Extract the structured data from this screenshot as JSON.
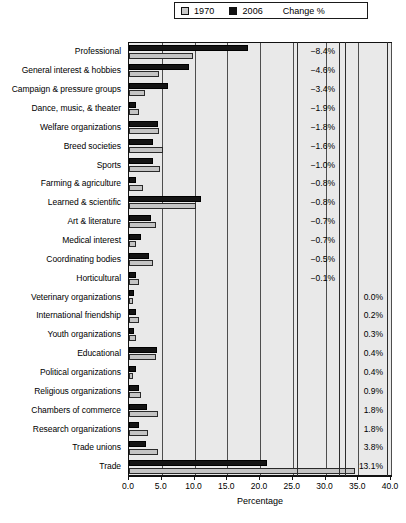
{
  "legend": {
    "items": [
      {
        "label": "1970",
        "color": "#c9c9c9",
        "icon": "legend-swatch-1970"
      },
      {
        "label": "2006",
        "color": "#121212",
        "icon": "legend-swatch-2006"
      }
    ],
    "change_label": "Change %"
  },
  "axis": {
    "title": "Percentage",
    "ticks": [
      "0.0",
      "5.0",
      "10.0",
      "15.0",
      "20.0",
      "25.0",
      "30.0",
      "35.0",
      "40.0"
    ]
  },
  "chart_data": {
    "type": "bar",
    "orientation": "horizontal",
    "title": "",
    "subtitle": "",
    "xlabel": "Percentage",
    "ylabel": "",
    "xlim": [
      0.0,
      40.0
    ],
    "xticks": [
      0.0,
      5.0,
      10.0,
      15.0,
      20.0,
      25.0,
      30.0,
      35.0,
      40.0
    ],
    "grid": true,
    "legend_position": "top",
    "categories": [
      "Professional",
      "General interest & hobbies",
      "Campaign & pressure groups",
      "Dance, music, & theater",
      "Welfare organizations",
      "Breed societies",
      "Sports",
      "Farming & agriculture",
      "Learned & scientific",
      "Art & literature",
      "Medical interest",
      "Coordinating bodies",
      "Horticultural",
      "Veterinary organizations",
      "International friendship",
      "Youth organizations",
      "Educational",
      "Political organizations",
      "Religious organizations",
      "Chambers of commerce",
      "Research organizations",
      "Trade unions",
      "Trade"
    ],
    "series": [
      {
        "name": "1970",
        "color": "#c9c9c9",
        "values": [
          9.8,
          4.6,
          2.4,
          1.5,
          4.6,
          5.2,
          4.7,
          2.2,
          10.2,
          4.1,
          1.1,
          3.6,
          1.5,
          0.6,
          1.5,
          1.1,
          4.1,
          0.6,
          1.9,
          4.4,
          2.9,
          4.4,
          34.5
        ]
      },
      {
        "name": "2006",
        "color": "#121212",
        "values": [
          18.2,
          9.2,
          5.9,
          1.1,
          4.4,
          3.7,
          3.7,
          1.1,
          11.0,
          3.4,
          1.8,
          3.1,
          1.1,
          0.7,
          1.0,
          0.7,
          4.3,
          1.0,
          1.5,
          2.8,
          1.5,
          2.6,
          21.0
        ]
      }
    ],
    "change_percent": [
      "−8.4%",
      "−4.6%",
      "−3.4%",
      "−1.9%",
      "−1.8%",
      "−1.6%",
      "−1.0%",
      "−0.8%",
      "−0.8%",
      "−0.7%",
      "−0.7%",
      "−0.5%",
      "−0.1%",
      "0.0%",
      "0.2%",
      "0.3%",
      "0.4%",
      "0.4%",
      "0.9%",
      "1.8%",
      "1.8%",
      "3.8%",
      "13.1%"
    ],
    "change_sign": [
      "neg",
      "neg",
      "neg",
      "neg",
      "neg",
      "neg",
      "neg",
      "neg",
      "neg",
      "neg",
      "neg",
      "neg",
      "neg",
      "pos",
      "pos",
      "pos",
      "pos",
      "pos",
      "pos",
      "pos",
      "pos",
      "pos",
      "pos"
    ]
  }
}
